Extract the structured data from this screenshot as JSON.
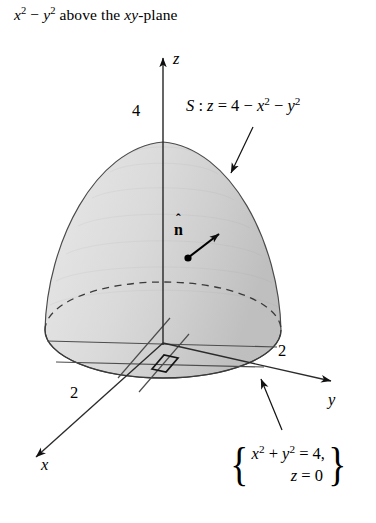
{
  "figure": {
    "caption": {
      "full_text": "x² − y² above the xy-plane",
      "part_x": "x",
      "part_exp2_a": "2",
      "part_minus": " − ",
      "part_y": "y",
      "part_exp2_b": "2",
      "part_rest": " above the ",
      "part_xy": "xy",
      "part_plane": "-plane"
    },
    "surface_label": {
      "name": "S",
      "colon": " : ",
      "equation": "z = 4 − x² − y²",
      "eq_z": "z",
      "eq_eq": " = 4 − ",
      "eq_x": "x",
      "eq_sup1": "2",
      "eq_minus": " − ",
      "eq_y": "y",
      "eq_sup2": "2"
    },
    "normal_vector": {
      "symbol": "n",
      "hat": "ˆ",
      "full": "n̂"
    },
    "boundary_curve": {
      "left_brace": "{",
      "right_brace": "}",
      "row1": "x² + y² = 4,",
      "row1_x": "x",
      "row1_sup1": "2",
      "row1_plus": " + ",
      "row1_y": "y",
      "row1_sup2": "2",
      "row1_eq": " = 4,",
      "row2": "z = 0",
      "row2_z": "z",
      "row2_eq": " = 0"
    },
    "axes": {
      "z_label": "z",
      "y_label": "y",
      "x_label": "x"
    },
    "ticks": {
      "z_tick": "4",
      "y_tick": "2",
      "x_tick": "2"
    },
    "colors": {
      "ink": "#000000",
      "background": "#ffffff",
      "surface_light": "#e4e4e4",
      "surface_mid": "#d4d4d4",
      "surface_dark": "#c2c2c2",
      "disk_fill": "#dcdcdc",
      "disk_light": "#ececec",
      "outline": "#3a3a3a"
    },
    "geometry": {
      "apex": [
        163,
        142
      ],
      "base_center": [
        163,
        330
      ],
      "base_rx": 118,
      "base_ry": 48,
      "origin": [
        163,
        343
      ],
      "z_axis_tip": [
        163,
        52
      ],
      "y_axis_tip": [
        338,
        383
      ],
      "x_axis_tip": [
        29,
        461
      ],
      "normal_dot": [
        188,
        258
      ],
      "normal_tip": [
        223,
        231
      ],
      "surface_leader_from": [
        252,
        128
      ],
      "surface_leader_to": [
        228,
        178
      ],
      "curve_leader_from": [
        281,
        430
      ],
      "curve_leader_to": [
        258,
        375
      ],
      "right_angle_marker": [
        155,
        357
      ]
    }
  }
}
